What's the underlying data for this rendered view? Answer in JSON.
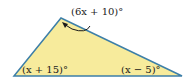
{
  "diagram": {
    "type": "triangle",
    "fill_color": "#f7eb9c",
    "stroke_color": "#3d7fa8",
    "arrow_color": "#1a1a1a",
    "vertices": {
      "left": [
        14,
        76
      ],
      "top": [
        61,
        18
      ],
      "right": [
        182,
        76
      ]
    },
    "angles": {
      "top": "(6x + 10)°",
      "left": "(x + 15)°",
      "right": "(x − 5)°"
    }
  }
}
